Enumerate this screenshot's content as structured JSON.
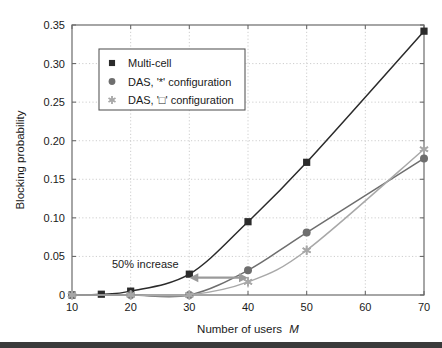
{
  "figure": {
    "background_color": "#ffffff",
    "frame_color": "#6b6b6b",
    "grid_color": "#c8c8c8"
  },
  "chart_data": {
    "type": "line",
    "title": "",
    "xlabel": "Number of users M",
    "xlabel_plain": "Number of users",
    "xlabel_italic": "M",
    "ylabel": "Blocking probability",
    "xlim": [
      10,
      70
    ],
    "ylim": [
      0,
      0.35
    ],
    "xticks": [
      10,
      20,
      30,
      40,
      50,
      60,
      70
    ],
    "xtick_labels": [
      "10",
      "20",
      "30",
      "40",
      "50",
      "60",
      "70"
    ],
    "yticks": [
      0,
      0.05,
      0.1,
      0.15,
      0.2,
      0.25,
      0.3,
      0.35
    ],
    "ytick_labels": [
      "0",
      "0.05",
      "0.10",
      "0.15",
      "0.20",
      "0.25",
      "0.30",
      "0.35"
    ],
    "grid": true,
    "grid_style": "dotted",
    "legend_position": "upper left",
    "series": [
      {
        "name": "Multi-cell",
        "marker": "square",
        "color": "#2b2b2b",
        "x": [
          10,
          15,
          20,
          30,
          40,
          50,
          70
        ],
        "values": [
          0.0,
          0.001,
          0.005,
          0.027,
          0.095,
          0.172,
          0.342
        ]
      },
      {
        "name": "DAS, '*' configuration",
        "marker": "circle",
        "color": "#6e6e6e",
        "x": [
          10,
          20,
          30,
          40,
          50,
          70
        ],
        "values": [
          0.0,
          0.0,
          0.0,
          0.032,
          0.081,
          0.177
        ]
      },
      {
        "name": "DAS, '□' configuration",
        "marker": "star",
        "color": "#a8a8a8",
        "x": [
          10,
          20,
          30,
          40,
          50,
          70
        ],
        "values": [
          0.0,
          0.0,
          0.0,
          0.017,
          0.058,
          0.189
        ]
      }
    ],
    "annotations": [
      {
        "text": "50% increase",
        "x": 31,
        "y": 0.047,
        "arrow": {
          "x_start": 30,
          "x_end": 40,
          "y": 0.0225,
          "double_headed": true,
          "color": "#9a9a9a"
        }
      }
    ]
  },
  "legend": {
    "items": [
      {
        "label": "Multi-cell",
        "marker": "square",
        "color": "#2b2b2b"
      },
      {
        "label": "DAS, '*' configuration",
        "marker": "circle",
        "color": "#6e6e6e"
      },
      {
        "label": "DAS, '□' configuration",
        "marker": "star",
        "color": "#a8a8a8"
      }
    ]
  }
}
